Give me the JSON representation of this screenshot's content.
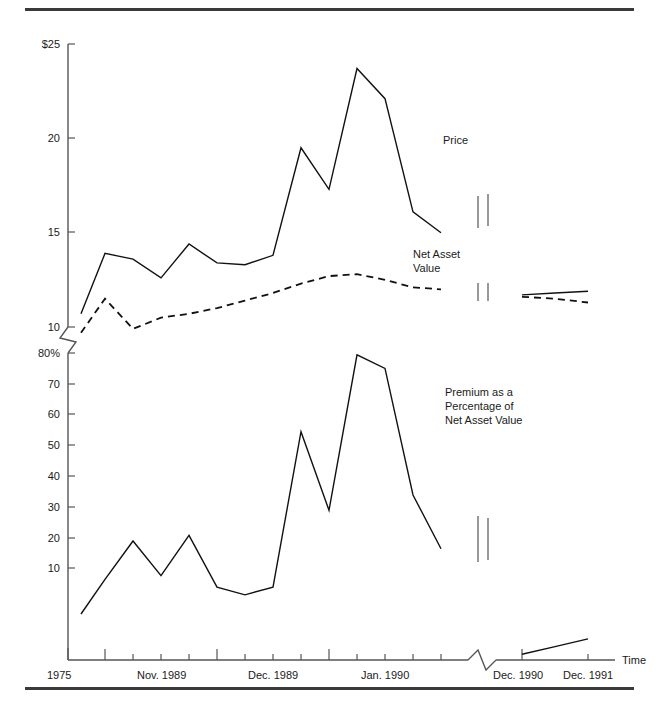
{
  "figure": {
    "top_rule": "",
    "bottom_rule": ""
  },
  "chart_data": {
    "type": "line",
    "title": "",
    "xlabel": "Time",
    "ylabel": "",
    "grid": false,
    "legend": "inline-annotations",
    "axis_breaks": {
      "y_break_label": "y-axis break between 10 and 80%",
      "x_break_label": "x-axis break before Dec. 1990"
    },
    "panels": [
      {
        "name": "price-and-nav",
        "ylim": [
          10,
          25
        ],
        "ytick_labels": [
          "$25",
          "20",
          "15",
          "10"
        ],
        "ytick_values": [
          25,
          20,
          15,
          10
        ],
        "series": [
          {
            "name": "Price",
            "style": "solid",
            "label": "Price",
            "x": [
              1,
              2,
              3,
              4,
              5,
              6,
              7,
              8,
              9,
              10,
              11,
              12,
              13,
              14,
              15,
              16,
              17
            ],
            "values": [
              10.7,
              13.9,
              13.6,
              12.6,
              14.4,
              13.4,
              13.3,
              13.8,
              19.5,
              17.3,
              23.7,
              22.1,
              16.1,
              15.0,
              11.7,
              11.8,
              11.9
            ]
          },
          {
            "name": "Net Asset Value",
            "style": "dashed",
            "label": "Net Asset\nValue",
            "x": [
              1,
              2,
              3,
              4,
              5,
              6,
              7,
              8,
              9,
              10,
              11,
              12,
              13,
              14,
              15,
              16,
              17
            ],
            "values": [
              9.7,
              11.5,
              9.9,
              10.5,
              10.7,
              11.0,
              11.4,
              11.8,
              12.3,
              12.7,
              12.8,
              12.5,
              12.1,
              12.0,
              11.6,
              11.5,
              11.3
            ]
          }
        ]
      },
      {
        "name": "premium-percentage",
        "ylim": [
          0,
          80
        ],
        "ytick_labels": [
          "80%",
          "70",
          "60",
          "50",
          "40",
          "30",
          "20",
          "10"
        ],
        "ytick_values": [
          80,
          70,
          60,
          50,
          40,
          30,
          20,
          10
        ],
        "series": [
          {
            "name": "Premium as a Percentage of Net Asset Value",
            "style": "solid",
            "label": "Premium as a\nPercentage of\nNet Asset Value",
            "x": [
              1,
              2,
              3,
              4,
              5,
              6,
              7,
              8,
              9,
              10,
              11,
              12,
              13,
              14,
              15,
              16,
              17
            ],
            "values": [
              12,
              21,
              31,
              22,
              32.5,
              19,
              17,
              19,
              59.5,
              39,
              79.5,
              76,
              43,
              29,
              1.5,
              3.5,
              5.5
            ]
          }
        ]
      }
    ],
    "xtick_labels": [
      "1975",
      "Nov. 1989",
      "Dec. 1989",
      "Jan. 1990",
      "Dec. 1990",
      "Dec. 1991"
    ]
  },
  "annotations": {
    "price": "Price",
    "net_asset_value_line1": "Net Asset",
    "net_asset_value_line2": "Value",
    "premium_line1": "Premium as a",
    "premium_line2": "Percentage of",
    "premium_line3": "Net Asset Value",
    "time_axis": "Time"
  },
  "y_labels_upper": {
    "t25": "$25",
    "t20": "20",
    "t15": "15",
    "t10": "10"
  },
  "y_labels_lower": {
    "t80": "80%",
    "t70": "70",
    "t60": "60",
    "t50": "50",
    "t40": "40",
    "t30": "30",
    "t20": "20",
    "t10": "10"
  },
  "x_labels": {
    "x1975": "1975",
    "xnov1989": "Nov. 1989",
    "xdec1989": "Dec. 1989",
    "xjan1990": "Jan. 1990",
    "xdec1990": "Dec. 1990",
    "xdec1991": "Dec. 1991"
  },
  "colors": {
    "ink": "#111111",
    "axis": "#555555",
    "rule": "#3a3a3a",
    "background": "#ffffff"
  }
}
